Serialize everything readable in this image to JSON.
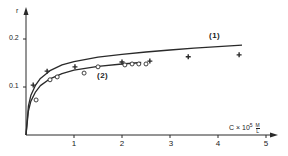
{
  "chart_data": {
    "type": "scatter",
    "title": "",
    "xlabel": "C × 10^5 M/L",
    "xlabel_parts": {
      "base": "C × 10",
      "exp": "5",
      "unit_num": "M",
      "unit_den": "L"
    },
    "ylabel": "r",
    "xlim": [
      0,
      5.2
    ],
    "ylim": [
      0,
      0.26
    ],
    "x_ticks": [
      "1",
      "2",
      "3",
      "4",
      "5"
    ],
    "y_ticks": [
      "0.1",
      "0.2"
    ],
    "grid": false,
    "series": [
      {
        "name": "(1)",
        "kind": "curve",
        "x": [
          0.0,
          0.05,
          0.1,
          0.2,
          0.3,
          0.5,
          0.75,
          1.0,
          1.5,
          2.0,
          2.5,
          3.0,
          3.5,
          4.0,
          4.5
        ],
        "y": [
          0.0,
          0.06,
          0.082,
          0.104,
          0.118,
          0.134,
          0.146,
          0.153,
          0.162,
          0.168,
          0.173,
          0.177,
          0.181,
          0.184,
          0.187
        ]
      },
      {
        "name": "(2)",
        "kind": "curve",
        "x": [
          0.0,
          0.05,
          0.1,
          0.2,
          0.3,
          0.5,
          0.75,
          1.0,
          1.5,
          2.0,
          2.4
        ],
        "y": [
          0.0,
          0.05,
          0.07,
          0.09,
          0.103,
          0.117,
          0.128,
          0.135,
          0.143,
          0.148,
          0.151
        ]
      },
      {
        "name": "plus markers",
        "kind": "points",
        "marker": "+",
        "x": [
          0.15,
          0.44,
          1.02,
          2.0,
          2.58,
          3.38,
          4.44
        ],
        "y": [
          0.104,
          0.133,
          0.142,
          0.152,
          0.154,
          0.163,
          0.167
        ]
      },
      {
        "name": "circle markers",
        "kind": "points",
        "marker": "o",
        "x": [
          0.21,
          0.5,
          0.65,
          1.21,
          1.5,
          2.06,
          2.21,
          2.35,
          2.5
        ],
        "y": [
          0.073,
          0.115,
          0.121,
          0.129,
          0.142,
          0.146,
          0.148,
          0.148,
          0.148
        ]
      }
    ],
    "annotations": [
      {
        "text": "(1)",
        "x": 3.95,
        "y": 0.2
      },
      {
        "text": "(2)",
        "x": 1.6,
        "y": 0.122
      }
    ],
    "legend": "none"
  }
}
